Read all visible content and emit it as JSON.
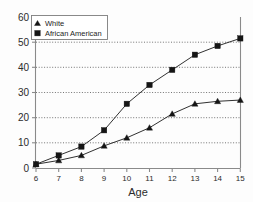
{
  "chart_data": {
    "type": "line",
    "title": "",
    "xlabel": "Age",
    "ylabel": "",
    "x": [
      6,
      7,
      8,
      9,
      10,
      11,
      12,
      13,
      14,
      15
    ],
    "xticklabels": [
      "6",
      "7",
      "8",
      "9",
      "10",
      "11",
      "12",
      "13",
      "14",
      "15"
    ],
    "yticklabels": [
      "0",
      "10",
      "20",
      "30",
      "40",
      "50",
      "60"
    ],
    "yticks": [
      0,
      10,
      20,
      30,
      40,
      50,
      60
    ],
    "xlim": [
      6,
      15
    ],
    "ylim": [
      0,
      60
    ],
    "grid": "horizontal-dotted",
    "legend_position": "top-left-inside",
    "series": [
      {
        "name": "White",
        "marker": "triangle",
        "color": "#151515",
        "values": [
          1.5,
          3.0,
          5.0,
          8.8,
          12.0,
          16.0,
          21.5,
          25.5,
          26.5,
          27.0
        ]
      },
      {
        "name": "African American",
        "marker": "square",
        "color": "#151515",
        "values": [
          1.5,
          5.0,
          8.5,
          15.0,
          25.5,
          33.0,
          39.0,
          45.0,
          48.5,
          51.5
        ]
      }
    ]
  },
  "legend": {
    "entries": [
      {
        "label": "White",
        "marker": "triangle-marker-icon"
      },
      {
        "label": "African American",
        "marker": "square-marker-icon"
      }
    ]
  },
  "axes": {
    "x_title": "Age"
  }
}
